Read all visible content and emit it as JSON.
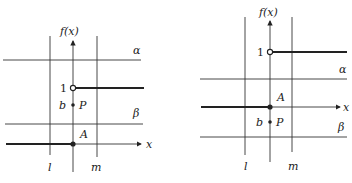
{
  "diagrams": [
    {
      "name": "left",
      "y_axis_label": "f(x)",
      "x_axis_label": "x",
      "horizontal_lines": {
        "upper": "α",
        "lower": "β"
      },
      "vertical_lines": {
        "left": "l",
        "right": "m"
      },
      "open_point_label": "1",
      "point_p": {
        "value_label": "b",
        "name": "P"
      },
      "point_a": {
        "name": "A"
      }
    },
    {
      "name": "right",
      "y_axis_label": "f(x)",
      "x_axis_label": "x",
      "horizontal_lines": {
        "upper": "α",
        "lower": "β"
      },
      "vertical_lines": {
        "left": "l",
        "right": "m"
      },
      "open_point_label": "1",
      "point_p": {
        "value_label": "b",
        "name": "P"
      },
      "point_a": {
        "name": "A"
      }
    }
  ]
}
